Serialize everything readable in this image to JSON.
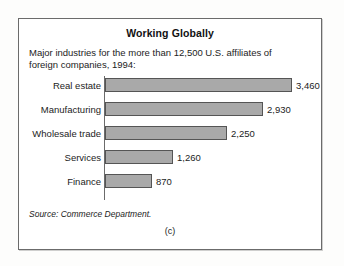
{
  "figure": {
    "title": "Working Globally",
    "subtitle": "Major industries for the more than 12,500 U.S. affiliates of foreign companies, 1994:",
    "source": "Source: Commerce Department.",
    "caption": "(c)",
    "bar_color": "#a9a9a9",
    "bar_border_color": "#555555",
    "box_border_color": "#6b6b6b"
  },
  "chart_data": {
    "type": "bar",
    "orientation": "horizontal",
    "title": "Working Globally",
    "subtitle": "Major industries for the more than 12,500 U.S. affiliates of foreign companies, 1994:",
    "categories": [
      "Real estate",
      "Manufacturing",
      "Wholesale trade",
      "Services",
      "Finance"
    ],
    "values": [
      3460,
      2930,
      2250,
      1260,
      870
    ],
    "value_labels": [
      "3,460",
      "2,930",
      "2,250",
      "1,260",
      "870"
    ],
    "xlabel": "",
    "ylabel": "",
    "xlim": [
      0,
      3460
    ],
    "grid": false,
    "legend": false,
    "source": "Source: Commerce Department."
  }
}
